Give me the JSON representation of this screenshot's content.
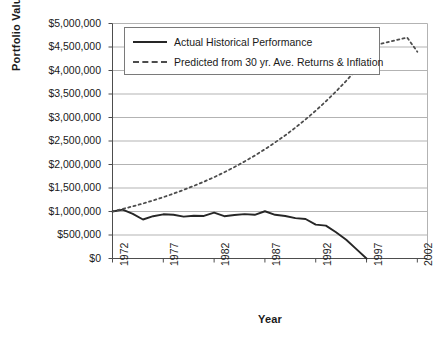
{
  "chart_data": {
    "type": "line",
    "title": "",
    "xlabel": "Year",
    "ylabel": "Portfolio Value",
    "xlim": [
      1972,
      2003
    ],
    "ylim": [
      0,
      5000000
    ],
    "grid": true,
    "legend_position": "top-center",
    "x_tick_labels": [
      "1972",
      "1977",
      "1982",
      "1987",
      "1992",
      "1997",
      "2002"
    ],
    "x_tick_values": [
      1972,
      1977,
      1982,
      1987,
      1992,
      1997,
      2002
    ],
    "y_tick_labels": [
      "$0",
      "$500,000",
      "$1,000,000",
      "$1,500,000",
      "$2,000,000",
      "$2,500,000",
      "$3,000,000",
      "$3,500,000",
      "$4,000,000",
      "$4,500,000",
      "$5,000,000"
    ],
    "y_tick_values": [
      0,
      500000,
      1000000,
      1500000,
      2000000,
      2500000,
      3000000,
      3500000,
      4000000,
      4500000,
      5000000
    ],
    "series": [
      {
        "name": "Actual Historical Performance",
        "style": "solid",
        "color": "#262626",
        "x": [
          1972,
          1973,
          1974,
          1975,
          1976,
          1977,
          1978,
          1979,
          1980,
          1981,
          1982,
          1983,
          1984,
          1985,
          1986,
          1987,
          1988,
          1989,
          1990,
          1991,
          1992,
          1993,
          1994,
          1995,
          1996,
          1997
        ],
        "values": [
          1000000,
          1040000,
          950000,
          830000,
          900000,
          940000,
          930000,
          890000,
          910000,
          905000,
          975000,
          900000,
          925000,
          945000,
          930000,
          1005000,
          930000,
          905000,
          860000,
          840000,
          720000,
          700000,
          560000,
          400000,
          200000,
          0
        ]
      },
      {
        "name": "Predicted from 30 yr. Ave. Returns & Inflation",
        "style": "dashed",
        "color": "#4d4d4d",
        "x": [
          1972,
          1973,
          1974,
          1975,
          1976,
          1977,
          1978,
          1979,
          1980,
          1981,
          1982,
          1983,
          1984,
          1985,
          1986,
          1987,
          1988,
          1989,
          1990,
          1991,
          1992,
          1993,
          1994,
          1995,
          1996,
          1997,
          1998,
          1999,
          2000,
          2001,
          2002
        ],
        "values": [
          1000000,
          1055000,
          1110000,
          1170000,
          1235000,
          1305000,
          1380000,
          1460000,
          1545000,
          1635000,
          1730000,
          1835000,
          1945000,
          2065000,
          2190000,
          2325000,
          2470000,
          2620000,
          2785000,
          2960000,
          3145000,
          3345000,
          3555000,
          3780000,
          4020000,
          4275000,
          4545000,
          4600000,
          4650000,
          4700000,
          4400000
        ]
      }
    ],
    "legend": [
      {
        "label": "Actual Historical Performance",
        "style": "solid",
        "swatch": "solid-line-swatch"
      },
      {
        "label": "Predicted from 30 yr. Ave. Returns & Inflation",
        "style": "dashed",
        "swatch": "dashed-line-swatch"
      }
    ]
  },
  "colors": {
    "grid": "#b3b3b3",
    "axis": "#4d4d4d",
    "actual_line": "#262626",
    "predicted_line": "#4d4d4d",
    "text": "#1a1a1a",
    "background": "#ffffff"
  }
}
